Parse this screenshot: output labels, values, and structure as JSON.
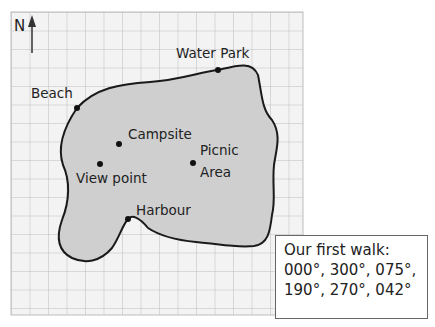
{
  "map": {
    "north_label": "N",
    "locations": [
      {
        "name": "Water Park",
        "x": 218,
        "y": 70,
        "label_x": 176,
        "label_y": 58
      },
      {
        "name": "Beach",
        "x": 77,
        "y": 108,
        "label_x": 31,
        "label_y": 98
      },
      {
        "name": "Campsite",
        "x": 119,
        "y": 144,
        "label_x": 128,
        "label_y": 139
      },
      {
        "name": "View point",
        "x": 100,
        "y": 164,
        "label_x": 76,
        "label_y": 183
      },
      {
        "name": "Picnic Area",
        "name_line1": "Picnic",
        "name_line2": "Area",
        "x": 193,
        "y": 163,
        "label_x": 200,
        "label_y": 155
      },
      {
        "name": "Harbour",
        "x": 128,
        "y": 219,
        "label_x": 136,
        "label_y": 215
      }
    ],
    "colors": {
      "land": "#cfcfcf",
      "grid": "#bdbdbd",
      "grid_bg": "#f3f3f3",
      "outline": "#1a1a1a"
    }
  },
  "walk_box": {
    "title": "Our first walk:",
    "line1": "000°, 300°, 075°,",
    "line2": "190°, 270°, 042°",
    "bearings": [
      "000°",
      "300°",
      "075°",
      "190°",
      "270°",
      "042°"
    ]
  }
}
